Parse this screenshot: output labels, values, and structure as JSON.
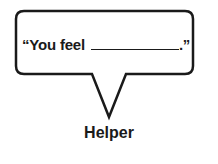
{
  "bubble": {
    "prefix": "“You feel",
    "blank": "",
    "suffix": ".”"
  },
  "label": "Helper",
  "colors": {
    "stroke": "#1a1a1a",
    "background": "#ffffff"
  }
}
